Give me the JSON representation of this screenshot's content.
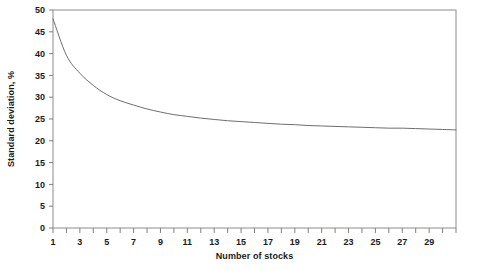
{
  "chart_data": {
    "type": "line",
    "title": "",
    "subtitle": "",
    "xlabel": "Number of stocks",
    "ylabel": "Standard deviation, %",
    "xlim": [
      1,
      31
    ],
    "ylim": [
      0,
      50
    ],
    "grid": false,
    "legend": null,
    "legend_position": "none",
    "y_ticks": [
      0,
      5,
      10,
      15,
      20,
      25,
      30,
      35,
      40,
      45,
      50
    ],
    "y_tick_labels": [
      "0",
      "5",
      "10",
      "15",
      "20",
      "25",
      "30",
      "35",
      "40",
      "45",
      "50"
    ],
    "x_ticks": [
      1,
      2,
      3,
      4,
      5,
      6,
      7,
      8,
      9,
      10,
      11,
      12,
      13,
      14,
      15,
      16,
      17,
      18,
      19,
      20,
      21,
      22,
      23,
      24,
      25,
      26,
      27,
      28,
      29,
      30,
      31
    ],
    "x_tick_labels_shown": [
      "1",
      "3",
      "5",
      "7",
      "9",
      "11",
      "13",
      "15",
      "17",
      "19",
      "21",
      "23",
      "25",
      "27",
      "29"
    ],
    "x_tick_labels_values": [
      1,
      3,
      5,
      7,
      9,
      11,
      13,
      15,
      17,
      19,
      21,
      23,
      25,
      27,
      29
    ],
    "line_color": "#6e6e6e",
    "line_width": 1.0,
    "axis_color": "#808080",
    "background": "#ffffff",
    "series": [
      {
        "name": "Portfolio standard deviation",
        "x": [
          1,
          2,
          3,
          4,
          5,
          6,
          7,
          8,
          9,
          10,
          11,
          12,
          13,
          14,
          15,
          16,
          17,
          18,
          19,
          20,
          21,
          22,
          23,
          24,
          25,
          26,
          27,
          28,
          29,
          30,
          31
        ],
        "values": [
          48.0,
          39.6,
          35.5,
          32.7,
          30.6,
          29.2,
          28.2,
          27.3,
          26.6,
          26.0,
          25.6,
          25.2,
          24.9,
          24.6,
          24.4,
          24.2,
          24.0,
          23.8,
          23.7,
          23.5,
          23.4,
          23.3,
          23.2,
          23.1,
          23.0,
          22.9,
          22.9,
          22.8,
          22.7,
          22.6,
          22.5
        ]
      }
    ]
  },
  "axis_titles": {
    "x": "Number of stocks",
    "y": "Standard deviation, %"
  }
}
